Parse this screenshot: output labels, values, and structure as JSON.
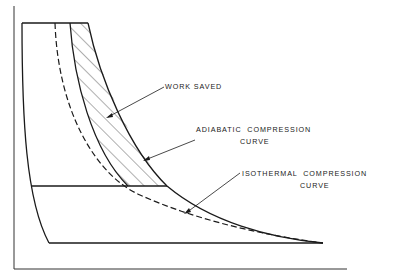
{
  "diagram": {
    "type": "pressure-volume compression diagram",
    "labels": {
      "work_saved": "WORK SAVED",
      "adiabatic_line1": "ADIABATIC  COMPRESSION",
      "adiabatic_line2": "CURVE",
      "isothermal_line1": "ISOTHERMAL  COMPRESSION",
      "isothermal_line2": "CURVE"
    },
    "colors": {
      "line": "#1a1a1a",
      "background": "#ffffff"
    }
  }
}
